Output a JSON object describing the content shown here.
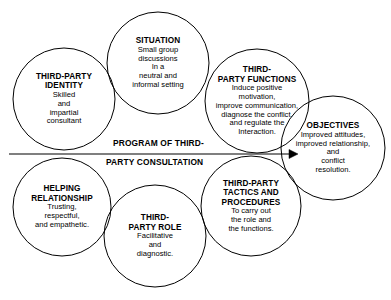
{
  "diagram": {
    "type": "venn-circles-process",
    "background_color": "#ffffff",
    "stroke_color": "#000000",
    "text_color": "#000000",
    "flow_label": {
      "line1": "PROGRAM OF THIRD-",
      "line2": "PARTY CONSULTATION"
    },
    "arrow": {
      "name": "process-arrow",
      "direction": "left-to-right",
      "from_x": 9,
      "to_x": 298,
      "y": 154,
      "head": "solid-triangle"
    },
    "nodes": [
      {
        "id": "third-party-identity",
        "title": "THIRD-PARTY\nIDENTITY",
        "body": "Skilled\nand\nimpartial\nconsultant",
        "cx": 64,
        "cy": 99,
        "r": 51
      },
      {
        "id": "situation",
        "title": "SITUATION",
        "body": "Small group\ndiscussions\nIn a\nneutral and\ninformal setting",
        "cx": 158,
        "cy": 63,
        "r": 51
      },
      {
        "id": "third-party-functions",
        "title": "THIRD-\nPARTY FUNCTIONS",
        "body": "Induce positive\nmotivation,\nimprove communication,\ndiagnose the conflict.\nand regulate the\nInteraction.",
        "cx": 257,
        "cy": 101,
        "r": 52
      },
      {
        "id": "objectives",
        "title": "OBJECTIVES",
        "body": "Improved attitudes,\nimproved relationship,\nand\nconflict\nresolution.",
        "cx": 333,
        "cy": 148,
        "r": 52
      },
      {
        "id": "helping-relationship",
        "title": "HELPING\nRELATIONSHIP",
        "body": "Trusting,\nrespectful,\nand empathetic.",
        "cx": 62,
        "cy": 207,
        "r": 49
      },
      {
        "id": "third-party-role",
        "title": "THIRD-\nPARTY ROLE",
        "body": "Facilitative\nand\ndiagnostic.",
        "cx": 155,
        "cy": 236,
        "r": 51
      },
      {
        "id": "third-party-tactics-and-procedures",
        "title": "THIRD-PARTY\nTACTICS AND\nPROCEDURES",
        "body": "To carry out\nthe role and\nthe functions.",
        "cx": 251,
        "cy": 206,
        "r": 50
      }
    ]
  }
}
